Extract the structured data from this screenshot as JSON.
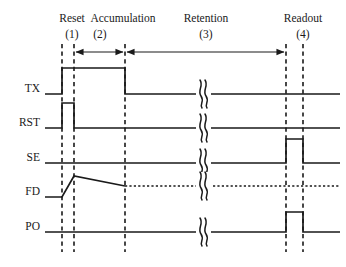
{
  "figure": {
    "kind": "timing-diagram",
    "title_visible": false,
    "width": 346,
    "height": 267,
    "background_color": "#ffffff",
    "line_color": "#1a1a1a"
  },
  "phases": [
    {
      "id": "reset",
      "name": "Reset",
      "number": "(1)",
      "label_x": 72,
      "name_y": 18,
      "num_y": 34,
      "span_start_x": 62,
      "span_end_x": 74,
      "arrow": "none"
    },
    {
      "id": "accumulation",
      "name": "Accumulation",
      "number": "(2)",
      "label_x": 123,
      "name_y": 18,
      "num_y": 34,
      "span_start_x": 74,
      "span_end_x": 125,
      "arrow": "double"
    },
    {
      "id": "retention",
      "name": "Retention",
      "number": "(3)",
      "label_x": 206,
      "name_y": 18,
      "num_y": 34,
      "span_start_x": 125,
      "span_end_x": 286,
      "arrow": "double"
    },
    {
      "id": "readout",
      "name": "Readout",
      "number": "(4)",
      "label_x": 303,
      "name_y": 18,
      "num_y": 34,
      "span_start_x": 286,
      "span_end_x": 303,
      "arrow": "none"
    }
  ],
  "phase_name_labels": [
    "Reset",
    "Accumulation",
    "Retention",
    "Readout"
  ],
  "phase_number_labels": [
    "(1)",
    "(2)",
    "(3)",
    "(4)"
  ],
  "markers": {
    "description": "vertical dashed time boundary lines",
    "x_positions": [
      62,
      74,
      125,
      286,
      303
    ],
    "top_y": 44,
    "bottom_y": 252
  },
  "arrow_row_y": 52,
  "break_symbol": {
    "name": "waveform-break-squiggle",
    "x": 203,
    "count": 5
  },
  "signals": [
    {
      "id": "tx",
      "label": "TX",
      "label_x": 40,
      "label_y": 88,
      "baseline_y": 94,
      "high_y": 68,
      "amplitude": 26,
      "type": "pulse",
      "pulses": [
        {
          "rise_x": 62,
          "fall_x": 125
        }
      ],
      "line_style": "solid"
    },
    {
      "id": "rst",
      "label": "RST",
      "label_x": 40,
      "label_y": 122,
      "baseline_y": 128,
      "high_y": 103,
      "amplitude": 25,
      "type": "pulse",
      "pulses": [
        {
          "rise_x": 62,
          "fall_x": 74
        }
      ],
      "line_style": "solid"
    },
    {
      "id": "se",
      "label": "SE",
      "label_x": 40,
      "label_y": 157,
      "baseline_y": 163,
      "high_y": 139,
      "amplitude": 24,
      "type": "pulse",
      "pulses": [
        {
          "rise_x": 286,
          "fall_x": 303
        }
      ],
      "line_style": "solid"
    },
    {
      "id": "fd",
      "label": "FD",
      "label_x": 40,
      "label_y": 191,
      "baseline_y": 197,
      "peak_y": 176,
      "ramp_start_x": 62,
      "peak_x": 74,
      "decay_end_x": 125,
      "decay_end_y": 186,
      "type": "ramp-decay",
      "line_style": "solid-then-dotted",
      "dotted_from_x": 125,
      "dotted_to_x": 340
    },
    {
      "id": "po",
      "label": "PO",
      "label_x": 40,
      "label_y": 226,
      "baseline_y": 232,
      "high_y": 212,
      "amplitude": 20,
      "type": "pulse",
      "pulses": [
        {
          "rise_x": 286,
          "fall_x": 303
        }
      ],
      "line_style": "solid"
    }
  ],
  "signal_labels": [
    "TX",
    "RST",
    "SE",
    "FD",
    "PO"
  ],
  "wave_extent": {
    "start_x": 45,
    "end_x": 340
  }
}
